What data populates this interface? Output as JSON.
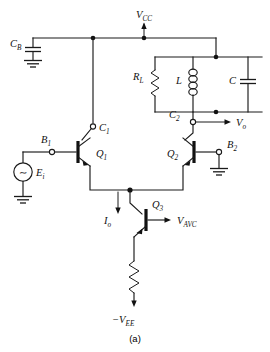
{
  "figure": {
    "caption": "(a)"
  },
  "supplies": {
    "positive_rail": "V",
    "positive_rail_sub": "CC",
    "negative_rail_sign": "−",
    "negative_rail": "V",
    "negative_rail_sub": "EE"
  },
  "components": [
    {
      "id": "CB",
      "label": "C",
      "sub": "B",
      "type": "capacitor"
    },
    {
      "id": "RL",
      "label": "R",
      "sub": "L",
      "type": "resistor"
    },
    {
      "id": "L",
      "label": "L",
      "sub": "",
      "type": "inductor"
    },
    {
      "id": "C",
      "label": "C",
      "sub": "",
      "type": "capacitor"
    },
    {
      "id": "RE",
      "label": "",
      "sub": "",
      "type": "resistor"
    },
    {
      "id": "Q1",
      "label": "Q",
      "sub": "1",
      "type": "npn-transistor"
    },
    {
      "id": "Q2",
      "label": "Q",
      "sub": "2",
      "type": "npn-transistor"
    },
    {
      "id": "Q3",
      "label": "Q",
      "sub": "3",
      "type": "npn-transistor"
    }
  ],
  "terminals": [
    {
      "id": "B1",
      "label": "B",
      "sub": "1"
    },
    {
      "id": "C1",
      "label": "C",
      "sub": "1"
    },
    {
      "id": "C2",
      "label": "C",
      "sub": "2"
    },
    {
      "id": "B2",
      "label": "B",
      "sub": "2"
    }
  ],
  "signals": [
    {
      "id": "Ei",
      "label": "E",
      "sub": "i",
      "type": "ac-source"
    },
    {
      "id": "Vo",
      "label": "V",
      "sub": "o",
      "type": "output"
    },
    {
      "id": "Io",
      "label": "I",
      "sub": "o",
      "type": "current"
    },
    {
      "id": "VAVC",
      "label": "V",
      "sub": "AVC",
      "type": "control-input"
    }
  ],
  "source_symbol": "∼",
  "colors": {
    "wire": "#1a1a1a",
    "background": "#ffffff",
    "node": "#111111",
    "caption": "#333333"
  }
}
